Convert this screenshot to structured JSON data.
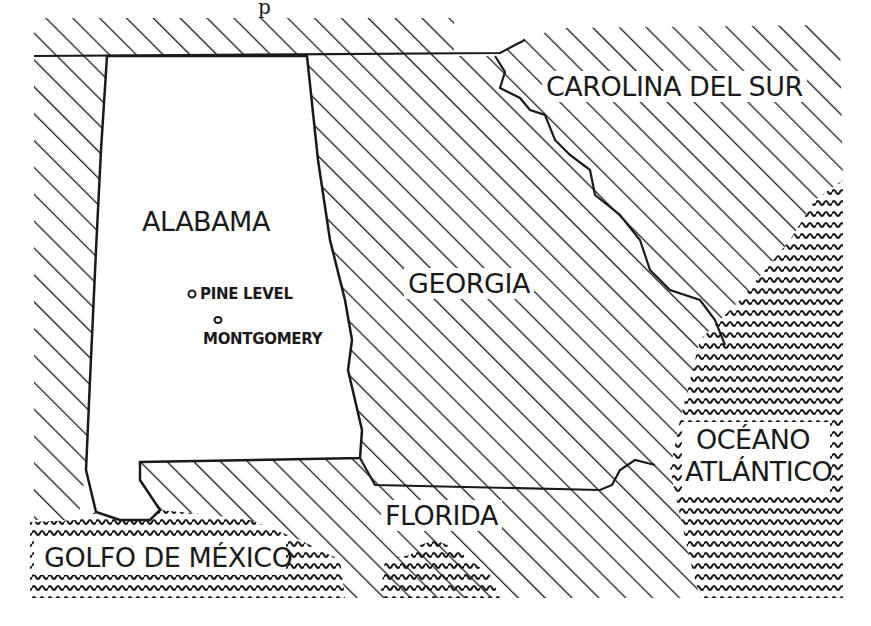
{
  "map": {
    "title_fragment": "p",
    "regions": [
      {
        "id": "alabama",
        "label": "ALABAMA",
        "fill": "blank"
      },
      {
        "id": "georgia",
        "label": "GEORGIA",
        "fill": "diagonal-hatch"
      },
      {
        "id": "carolina-del-sur",
        "label": "CAROLINA DEL SUR",
        "fill": "diagonal-hatch"
      },
      {
        "id": "florida",
        "label": "FLORIDA",
        "fill": "diagonal-hatch"
      }
    ],
    "water": [
      {
        "id": "golfo-de-mexico",
        "label": "GOLFO DE MÉXICO",
        "fill": "wavy-lines"
      },
      {
        "id": "oceano-atlantico",
        "label_line1": "OCÉANO",
        "label_line2": "ATLÁNTICO",
        "fill": "wavy-lines"
      }
    ],
    "cities": [
      {
        "id": "pine-level",
        "label": "PINE LEVEL",
        "marker": "circle"
      },
      {
        "id": "montgomery",
        "label": "MONTGOMERY",
        "marker": "circle"
      }
    ],
    "colors": {
      "ink": "#1a1a1a",
      "paper": "#ffffff"
    }
  }
}
